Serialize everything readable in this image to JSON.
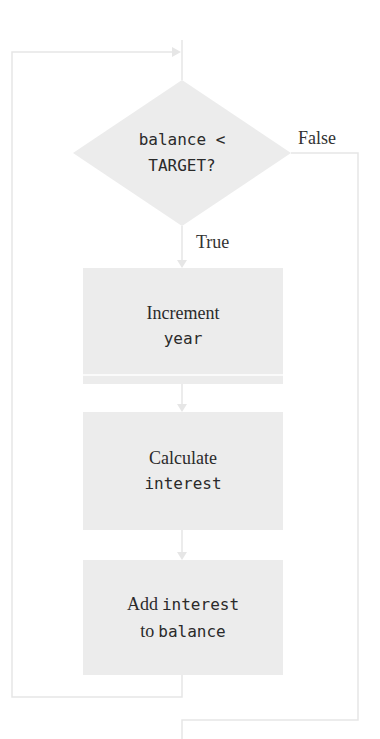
{
  "diagram": {
    "type": "flowchart",
    "decision": {
      "line1": "balance <",
      "line2": "TARGET?"
    },
    "branches": {
      "true_label": "True",
      "false_label": "False"
    },
    "steps": [
      {
        "serif": "Increment",
        "mono": "year"
      },
      {
        "serif": "Calculate",
        "mono": "interest"
      },
      {
        "serif_a": "Add",
        "mono_a": "interest",
        "serif_b": "to",
        "mono_b": "balance"
      }
    ],
    "colors": {
      "shape_fill": "#ececec",
      "line": "#e6e6e6",
      "text": "#2a2a2a"
    }
  }
}
